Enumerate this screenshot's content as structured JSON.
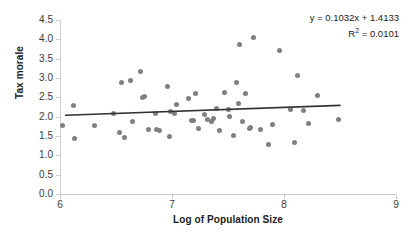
{
  "chart_data": {
    "type": "scatter",
    "title": "",
    "xlabel": "Log of Population Size",
    "ylabel": "Tax morale",
    "xlim": [
      6,
      9
    ],
    "ylim": [
      0.0,
      4.5
    ],
    "xticks": [
      "6",
      "7",
      "8",
      "9"
    ],
    "yticks": [
      "0.0",
      "0.5",
      "1.0",
      "1.5",
      "2.0",
      "2.5",
      "3.0",
      "3.5",
      "4.0",
      "4.5"
    ],
    "grid": false,
    "legend": false,
    "point_color": "#808080",
    "trendline_color": "#333333",
    "annotations": {
      "equation": "y = 0.1032x + 1.4133",
      "r_squared_label": "R",
      "r_squared_sup": "2",
      "r_squared_value": " = 0.0101"
    },
    "trendline": {
      "slope": 0.1032,
      "intercept": 1.4133,
      "r2": 0.0101,
      "x_start": 6.05,
      "y_start": 2.038,
      "x_end": 8.5,
      "y_end": 2.291
    },
    "points": [
      [
        6.02,
        1.77
      ],
      [
        6.12,
        2.28
      ],
      [
        6.13,
        1.43
      ],
      [
        6.31,
        1.77
      ],
      [
        6.48,
        2.08
      ],
      [
        6.53,
        1.58
      ],
      [
        6.55,
        2.89
      ],
      [
        6.58,
        1.45
      ],
      [
        6.63,
        2.94
      ],
      [
        6.65,
        1.88
      ],
      [
        6.72,
        3.18
      ],
      [
        6.74,
        2.5
      ],
      [
        6.75,
        2.52
      ],
      [
        6.79,
        1.68
      ],
      [
        6.85,
        2.07
      ],
      [
        6.86,
        1.66
      ],
      [
        6.89,
        1.65
      ],
      [
        6.96,
        2.77
      ],
      [
        6.98,
        1.5
      ],
      [
        6.99,
        2.14
      ],
      [
        7.02,
        2.09
      ],
      [
        7.04,
        2.31
      ],
      [
        7.15,
        2.46
      ],
      [
        7.17,
        1.91
      ],
      [
        7.19,
        1.9
      ],
      [
        7.21,
        2.59
      ],
      [
        7.24,
        1.69
      ],
      [
        7.29,
        2.05
      ],
      [
        7.32,
        1.92
      ],
      [
        7.35,
        1.88
      ],
      [
        7.37,
        1.96
      ],
      [
        7.4,
        2.2
      ],
      [
        7.42,
        1.63
      ],
      [
        7.47,
        2.63
      ],
      [
        7.5,
        2.18
      ],
      [
        7.51,
        2.0
      ],
      [
        7.55,
        1.52
      ],
      [
        7.58,
        2.88
      ],
      [
        7.59,
        2.35
      ],
      [
        7.6,
        3.87
      ],
      [
        7.63,
        1.87
      ],
      [
        7.66,
        2.6
      ],
      [
        7.69,
        1.7
      ],
      [
        7.7,
        1.72
      ],
      [
        7.73,
        4.04
      ],
      [
        7.79,
        1.67
      ],
      [
        7.86,
        1.28
      ],
      [
        7.9,
        1.81
      ],
      [
        7.96,
        3.72
      ],
      [
        8.06,
        2.18
      ],
      [
        8.09,
        1.32
      ],
      [
        8.12,
        3.06
      ],
      [
        8.17,
        2.15
      ],
      [
        8.22,
        1.82
      ],
      [
        8.3,
        2.56
      ],
      [
        8.49,
        1.92
      ]
    ]
  },
  "axes": {
    "y_title": "Tax morale",
    "x_title": "Log of Population Size"
  }
}
